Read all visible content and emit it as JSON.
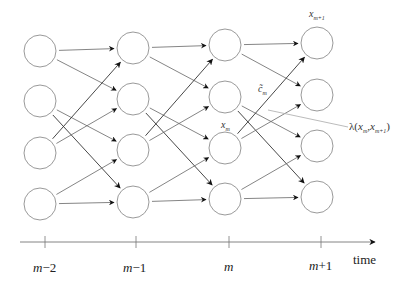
{
  "diagram": {
    "type": "trellis",
    "colors": {
      "node_stroke": "#9a9a9a",
      "edge": "#666666",
      "edge_dark": "#333333",
      "axis": "#777777",
      "text": "#222222"
    },
    "columns": [
      {
        "x": 40,
        "rows_y": [
          51,
          101,
          153,
          204
        ]
      },
      {
        "x": 133,
        "rows_y": [
          48,
          99,
          150,
          202
        ]
      },
      {
        "x": 225,
        "rows_y": [
          45,
          97,
          148,
          199
        ]
      },
      {
        "x": 317,
        "rows_y": [
          43,
          95,
          146,
          197
        ]
      }
    ],
    "node_radius": 16,
    "transitions": [
      [
        0,
        0
      ],
      [
        0,
        1
      ],
      [
        1,
        2
      ],
      [
        1,
        3
      ],
      [
        2,
        0
      ],
      [
        2,
        1
      ],
      [
        3,
        2
      ],
      [
        3,
        3
      ]
    ],
    "axis": {
      "y": 242,
      "x_start": 20,
      "x_end": 375,
      "ticks": [
        {
          "x": 45,
          "label_var": "m",
          "label_op": "−2"
        },
        {
          "x": 136,
          "label_var": "m",
          "label_op": "−1"
        },
        {
          "x": 229,
          "label_var": "m",
          "label_op": ""
        },
        {
          "x": 321,
          "label_var": "m",
          "label_op": "+1"
        }
      ],
      "axis_label": "time"
    },
    "annotations": {
      "x_m": {
        "base": "x",
        "sub": "m"
      },
      "x_m1": {
        "base": "x",
        "sub": "m+1"
      },
      "c_tilde": {
        "base": "c̃",
        "sub": "m"
      },
      "lambda": {
        "prefix": "λ(",
        "a_base": "x",
        "a_sub": "m",
        "sep": ",",
        "b_base": "x",
        "b_sub": "m+1",
        "suffix": ")"
      },
      "lambda_leader": {
        "x1": 268,
        "y1": 110,
        "x2": 348,
        "y2": 127
      }
    }
  }
}
